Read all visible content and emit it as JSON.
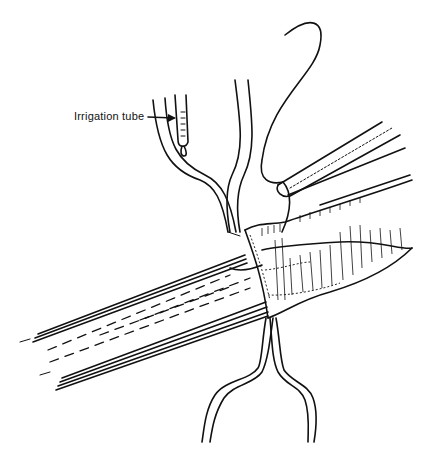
{
  "figure": {
    "type": "surgical line illustration",
    "labels": {
      "irrigation_tube": "Irrigation tube"
    },
    "parts": [
      "vessel",
      "anastomosis",
      "upper-forceps",
      "lower-forceps",
      "needle-holder",
      "suture-needle",
      "irrigation-tube"
    ],
    "colors": {
      "ink": "#111111",
      "background": "#ffffff"
    }
  }
}
